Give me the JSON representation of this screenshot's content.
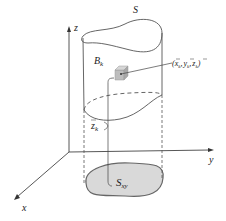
{
  "figure": {
    "labels": {
      "surface": "S",
      "box": "B",
      "box_sub": "k",
      "point_open": "(",
      "point_x": "x",
      "point_x_sub": "k",
      "point_y": "y",
      "point_y_sub": "k",
      "point_z": "z",
      "point_z_sub": "k",
      "point_close": ")",
      "point_sep": ",",
      "height": "z",
      "height_sub": "k",
      "projection": "S",
      "projection_sub": "xy",
      "axis_x": "x",
      "axis_y": "y",
      "axis_z": "z"
    },
    "colors": {
      "stroke": "#555555",
      "projection_fill": "#d9d9d9",
      "box_fill": "#bdbdbd"
    }
  }
}
